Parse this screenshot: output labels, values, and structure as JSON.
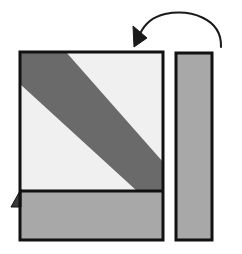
{
  "figure": {
    "canvas": {
      "width": 242,
      "height": 254,
      "background": "#ffffff"
    },
    "palette": {
      "outline": "#111111",
      "light_face": "#f0f0f0",
      "mid_gray": "#a8a8a8",
      "dark_gray": "#6a6a6a",
      "arrow": "#1a1a1a",
      "background": "#ffffff"
    },
    "shapes": {
      "left_panel": {
        "label": "left square panel",
        "x": 20,
        "y": 52,
        "width": 143,
        "height": 188,
        "stroke_width": 3,
        "upper_face": {
          "label": "upper light face",
          "fill": "#f0f0f0",
          "points": "20,52 163,52 163,191 20,191"
        },
        "diagonal_band": {
          "label": "dark diagonal stripe",
          "fill": "#6a6a6a",
          "points": "20,52 66,52 163,162 163,191 137,191 20,84"
        },
        "lower_face": {
          "label": "lower gray face",
          "fill": "#a8a8a8",
          "points": "20,191 163,191 163,240 20,240"
        },
        "divider": {
          "label": "horizontal fold line",
          "y": 191,
          "x1": 20,
          "x2": 163
        },
        "tab": {
          "label": "small protruding corner tab",
          "fill": "#3a3a3a",
          "points": "20,189 20,206 11,206"
        }
      },
      "right_panel": {
        "label": "right tall rectangle",
        "x": 176,
        "y": 53,
        "width": 36,
        "height": 187,
        "fill": "#a8a8a8",
        "stroke_width": 3
      },
      "arrow": {
        "label": "curved rotation arrow",
        "color": "#1a1a1a",
        "stroke_width": 2,
        "path": "M 221,47 C 221,16 186,10 161,16 C 150,19 143,26 139,34",
        "head_points": "135,46 134,28 148,37",
        "direction": "counter-clockwise, pointing down-left"
      }
    }
  }
}
